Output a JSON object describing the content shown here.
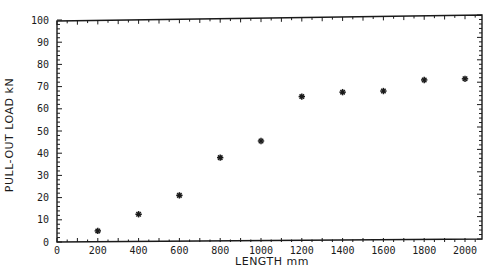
{
  "chart_data": {
    "type": "scatter",
    "title": "",
    "xlabel": "LENGTH mm",
    "ylabel": "PULL-OUT LOAD kN",
    "xlim": [
      0,
      2100
    ],
    "ylim": [
      0,
      100
    ],
    "x_ticks": [
      0,
      200,
      400,
      600,
      800,
      1000,
      1200,
      1400,
      1600,
      1800,
      2000
    ],
    "y_ticks": [
      0,
      10,
      20,
      30,
      40,
      50,
      60,
      70,
      80,
      90,
      100
    ],
    "x_tick_labels": [
      "0",
      "200",
      "400",
      "600",
      "800",
      "1000",
      "1200",
      "1400",
      "1600",
      "1800",
      "2000"
    ],
    "y_tick_labels": [
      "0",
      "10",
      "20",
      "30",
      "40",
      "50",
      "60",
      "70",
      "80",
      "90",
      "100"
    ],
    "grid": false,
    "legend": null,
    "marker": "asterisk",
    "series": [
      {
        "name": "Pull-out load",
        "x": [
          200,
          400,
          600,
          800,
          1000,
          1200,
          1400,
          1600,
          1800,
          2000
        ],
        "y": [
          5,
          12.5,
          21,
          38,
          45.5,
          65.5,
          67.5,
          68,
          73,
          73.5
        ]
      }
    ]
  }
}
